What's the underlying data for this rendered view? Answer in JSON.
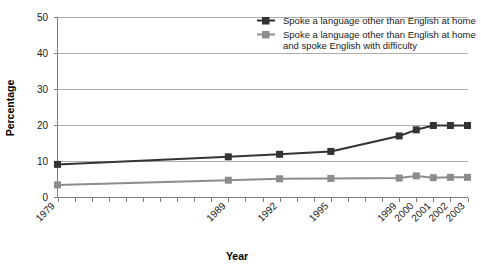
{
  "chart_data": {
    "type": "line",
    "title": "",
    "xlabel": "Year",
    "ylabel": "Percentage",
    "ylim": [
      0,
      50
    ],
    "yticks": [
      0,
      10,
      20,
      30,
      40,
      50
    ],
    "grid": true,
    "legend_position": "top-right",
    "x_tick_labels": [
      "1979",
      "1989",
      "1992",
      "1995",
      "1999",
      "2000",
      "2001",
      "2002",
      "2003"
    ],
    "x_axis_note": "Evenly spaced yearly tick marks from 1979 to 2003; only selected years are labeled",
    "x_years_all": [
      1979,
      1980,
      1981,
      1982,
      1983,
      1984,
      1985,
      1986,
      1987,
      1988,
      1989,
      1990,
      1991,
      1992,
      1993,
      1994,
      1995,
      1996,
      1997,
      1998,
      1999,
      2000,
      2001,
      2002,
      2003
    ],
    "series": [
      {
        "name": "Spoke a language other than English at home",
        "color": "#333333",
        "marker": "square",
        "x": [
          1979,
          1989,
          1992,
          1995,
          1999,
          2000,
          2001,
          2002,
          2003
        ],
        "values": [
          9.2,
          11.3,
          12.0,
          12.8,
          17.1,
          18.8,
          20.0,
          20.0,
          20.0
        ]
      },
      {
        "name": "Spoke a language other than English at home and spoke English with difficulty",
        "color": "#8c8c8c",
        "marker": "square",
        "x": [
          1979,
          1989,
          1992,
          1995,
          1999,
          2000,
          2001,
          2002,
          2003
        ],
        "values": [
          3.5,
          4.8,
          5.2,
          5.3,
          5.4,
          6.0,
          5.5,
          5.6,
          5.6
        ]
      }
    ]
  },
  "legend": {
    "entries": [
      {
        "label": "Spoke a language other than English at home",
        "label_line2": ""
      },
      {
        "label": "Spoke a language other than English at home",
        "label_line2": "and spoke English with difficulty"
      }
    ]
  },
  "axes": {
    "y_label": "Percentage",
    "x_label": "Year",
    "y_tick_0": "0",
    "y_tick_10": "10",
    "y_tick_20": "20",
    "y_tick_30": "30",
    "y_tick_40": "40",
    "y_tick_50": "50",
    "x_tick_1": "1979",
    "x_tick_2": "1989",
    "x_tick_3": "1992",
    "x_tick_4": "1995",
    "x_tick_5": "1999",
    "x_tick_6": "2000",
    "x_tick_7": "2001",
    "x_tick_8": "2002",
    "x_tick_9": "2003"
  }
}
